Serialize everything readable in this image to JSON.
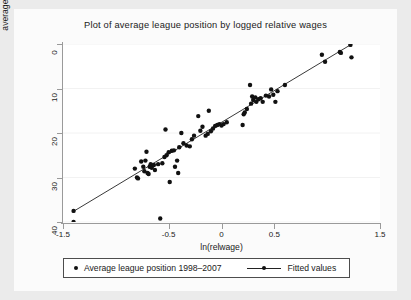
{
  "chart_data": {
    "type": "scatter",
    "title": "Plot of average league position by logged relative wages",
    "xlabel": "ln(relwage)",
    "ylabel": "average league position",
    "xlim": [
      -1.5,
      1.5
    ],
    "ylim": [
      0,
      40
    ],
    "y_inverted": true,
    "grid": "horizontal-light",
    "legend_position": "bottom",
    "xticks": [
      -1.5,
      -0.5,
      0,
      0.5,
      1.5
    ],
    "xtick_labels": [
      "-1.5",
      "-0.5",
      "0",
      "0.5",
      "1.5"
    ],
    "yticks": [
      0,
      10,
      20,
      30,
      40
    ],
    "ytick_labels": [
      "0",
      "10",
      "20",
      "30",
      "40"
    ],
    "series": [
      {
        "name": "Average league position 1998–2007",
        "marker": "filled-circle",
        "color": "#111111",
        "points": [
          [
            -1.4,
            37.5
          ],
          [
            -1.4,
            40.0
          ],
          [
            -0.82,
            28.0
          ],
          [
            -0.8,
            30.0
          ],
          [
            -0.79,
            30.2
          ],
          [
            -0.76,
            26.4
          ],
          [
            -0.74,
            27.6
          ],
          [
            -0.73,
            28.6
          ],
          [
            -0.72,
            26.2
          ],
          [
            -0.71,
            24.2
          ],
          [
            -0.7,
            29.0
          ],
          [
            -0.69,
            29.2
          ],
          [
            -0.68,
            27.6
          ],
          [
            -0.67,
            27.0
          ],
          [
            -0.66,
            27.8
          ],
          [
            -0.64,
            27.2
          ],
          [
            -0.63,
            28.3
          ],
          [
            -0.6,
            27.0
          ],
          [
            -0.58,
            39.2
          ],
          [
            -0.56,
            26.8
          ],
          [
            -0.54,
            25.4
          ],
          [
            -0.53,
            19.2
          ],
          [
            -0.52,
            25.0
          ],
          [
            -0.5,
            24.3
          ],
          [
            -0.49,
            31.0
          ],
          [
            -0.47,
            24.0
          ],
          [
            -0.45,
            23.9
          ],
          [
            -0.44,
            27.6
          ],
          [
            -0.42,
            26.2
          ],
          [
            -0.41,
            29.0
          ],
          [
            -0.4,
            23.2
          ],
          [
            -0.38,
            20.0
          ],
          [
            -0.36,
            22.3
          ],
          [
            -0.33,
            22.8
          ],
          [
            -0.3,
            23.0
          ],
          [
            -0.28,
            21.4
          ],
          [
            -0.26,
            20.6
          ],
          [
            -0.22,
            16.2
          ],
          [
            -0.2,
            19.5
          ],
          [
            -0.18,
            18.6
          ],
          [
            -0.15,
            20.6
          ],
          [
            -0.13,
            20.2
          ],
          [
            -0.12,
            15.0
          ],
          [
            -0.1,
            19.6
          ],
          [
            -0.08,
            19.0
          ],
          [
            -0.06,
            18.4
          ],
          [
            -0.04,
            18.2
          ],
          [
            -0.02,
            18.0
          ],
          [
            0.0,
            18.3
          ],
          [
            0.02,
            18.0
          ],
          [
            0.05,
            17.6
          ],
          [
            0.2,
            18.2
          ],
          [
            0.21,
            15.8
          ],
          [
            0.22,
            15.4
          ],
          [
            0.24,
            14.6
          ],
          [
            0.27,
            9.2
          ],
          [
            0.28,
            13.4
          ],
          [
            0.29,
            11.8
          ],
          [
            0.3,
            12.6
          ],
          [
            0.32,
            12.0
          ],
          [
            0.33,
            13.0
          ],
          [
            0.35,
            12.4
          ],
          [
            0.37,
            12.2
          ],
          [
            0.39,
            13.0
          ],
          [
            0.42,
            11.6
          ],
          [
            0.45,
            11.8
          ],
          [
            0.47,
            10.2
          ],
          [
            0.49,
            11.4
          ],
          [
            0.51,
            13.0
          ],
          [
            0.53,
            10.6
          ],
          [
            0.6,
            9.2
          ],
          [
            0.95,
            2.4
          ],
          [
            0.98,
            4.0
          ],
          [
            1.12,
            1.8
          ],
          [
            1.13,
            2.0
          ],
          [
            1.22,
            0.2
          ],
          [
            1.23,
            3.0
          ]
        ]
      },
      {
        "name": "Fitted values",
        "marker": "line",
        "color": "#222222",
        "line": {
          "x0": -1.4,
          "y0": 37.6,
          "x1": 1.22,
          "y1": 0.2
        }
      }
    ]
  },
  "chart": {
    "title": "Plot of average league position by logged relative wages",
    "xtitle": "ln(relwage)",
    "ytitle": "average league position"
  },
  "legend": {
    "scatter_label": "Average league position 1998–2007",
    "fit_label": "Fitted values"
  },
  "colors": {
    "marker": "#111111",
    "fit_line": "#222222",
    "axis": "#9a9a9a",
    "plot_bg": "#ffffff",
    "figure_bg": "#ebebeb",
    "grid": "#f2f2f2"
  }
}
